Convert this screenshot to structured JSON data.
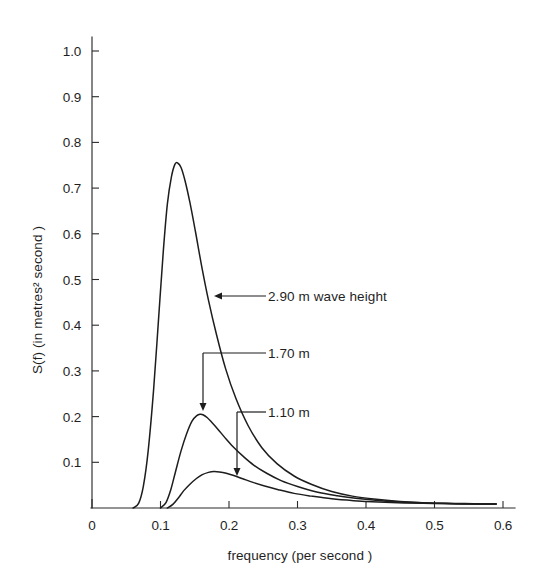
{
  "chart_data": {
    "type": "line",
    "title": "",
    "xlabel": "frequency  (per second )",
    "ylabel": "S(f)   (in metres² second )",
    "xlim": [
      0,
      0.6
    ],
    "ylim": [
      0,
      1.0
    ],
    "grid": false,
    "legend_position": "inline-annotations",
    "xticks": [
      0,
      0.1,
      0.2,
      0.3,
      0.4,
      0.5,
      0.6
    ],
    "xtick_labels": [
      "0",
      "0.1",
      "0.2",
      "0.3",
      "0.4",
      "0.5",
      "0.6"
    ],
    "xtick_labels_visible": [
      "0",
      "0.1",
      "0.2",
      "0.3",
      "0.4",
      "0.5",
      "0.6"
    ],
    "yticks": [
      0,
      0.1,
      0.2,
      0.3,
      0.4,
      0.5,
      0.6,
      0.7,
      0.8,
      0.9,
      1.0
    ],
    "ytick_labels": [
      "0.1",
      "0.2",
      "0.3",
      "0.4",
      "0.5",
      "0.6",
      "0.7",
      "0.8",
      "0.9",
      "1.0"
    ],
    "series": [
      {
        "name": "2.90 m wave height",
        "peak_x": 0.125,
        "peak_y": 0.755,
        "onset_x": 0.065,
        "x": [
          0.06,
          0.068,
          0.075,
          0.082,
          0.09,
          0.097,
          0.104,
          0.11,
          0.116,
          0.121,
          0.125,
          0.13,
          0.136,
          0.143,
          0.151,
          0.16,
          0.17,
          0.182,
          0.195,
          0.21,
          0.228,
          0.248,
          0.27,
          0.295,
          0.32,
          0.35,
          0.38,
          0.415,
          0.45,
          0.49,
          0.53,
          0.57,
          0.59
        ],
        "y": [
          0.0,
          0.01,
          0.048,
          0.125,
          0.26,
          0.41,
          0.56,
          0.665,
          0.725,
          0.752,
          0.755,
          0.745,
          0.715,
          0.668,
          0.605,
          0.53,
          0.455,
          0.378,
          0.305,
          0.24,
          0.18,
          0.132,
          0.097,
          0.07,
          0.052,
          0.036,
          0.026,
          0.019,
          0.014,
          0.011,
          0.01,
          0.009,
          0.009
        ]
      },
      {
        "name": "1.70 m",
        "peak_x": 0.16,
        "peak_y": 0.205,
        "onset_x": 0.103,
        "x": [
          0.1,
          0.108,
          0.115,
          0.122,
          0.13,
          0.138,
          0.146,
          0.153,
          0.158,
          0.162,
          0.168,
          0.175,
          0.184,
          0.194,
          0.206,
          0.22,
          0.236,
          0.255,
          0.276,
          0.3,
          0.328,
          0.358,
          0.392,
          0.43,
          0.47,
          0.515,
          0.56,
          0.59
        ],
        "y": [
          0.0,
          0.012,
          0.04,
          0.08,
          0.125,
          0.162,
          0.19,
          0.202,
          0.205,
          0.204,
          0.198,
          0.187,
          0.172,
          0.154,
          0.134,
          0.114,
          0.094,
          0.076,
          0.06,
          0.047,
          0.035,
          0.027,
          0.02,
          0.015,
          0.012,
          0.01,
          0.009,
          0.009
        ]
      },
      {
        "name": "1.10 m",
        "peak_x": 0.178,
        "peak_y": 0.08,
        "onset_x": 0.112,
        "x": [
          0.11,
          0.118,
          0.126,
          0.134,
          0.143,
          0.152,
          0.161,
          0.17,
          0.178,
          0.186,
          0.196,
          0.207,
          0.22,
          0.235,
          0.252,
          0.272,
          0.295,
          0.32,
          0.35,
          0.382,
          0.418,
          0.456,
          0.498,
          0.54,
          0.575,
          0.59
        ],
        "y": [
          0.0,
          0.008,
          0.022,
          0.038,
          0.052,
          0.064,
          0.073,
          0.078,
          0.08,
          0.079,
          0.076,
          0.071,
          0.064,
          0.056,
          0.048,
          0.04,
          0.032,
          0.026,
          0.02,
          0.016,
          0.013,
          0.011,
          0.01,
          0.009,
          0.009,
          0.009
        ]
      }
    ],
    "annotations": [
      {
        "label": "2.90 m  wave height",
        "target_series": "2.90 m wave height",
        "text_x": 268,
        "text_y": 301,
        "line": {
          "x1": 216,
          "y1": 296,
          "x2": 266,
          "y2": 296
        },
        "arrow": {
          "x": 214,
          "y": 296,
          "dir": "left"
        }
      },
      {
        "label": "1.70 m",
        "target_series": "1.70 m",
        "text_x": 268,
        "text_y": 358,
        "line_h": {
          "x1": 203,
          "y1": 353,
          "x2": 266,
          "y2": 353
        },
        "line_v": {
          "x1": 203,
          "y1": 353,
          "x2": 203,
          "y2": 409
        },
        "arrow": {
          "x": 203,
          "y": 411,
          "dir": "down"
        }
      },
      {
        "label": "1.10 m",
        "target_series": "1.10 m",
        "text_x": 268,
        "text_y": 417,
        "line_h": {
          "x1": 237,
          "y1": 412,
          "x2": 266,
          "y2": 412
        },
        "line_v": {
          "x1": 237,
          "y1": 412,
          "x2": 237,
          "y2": 474
        },
        "arrow": {
          "x": 237,
          "y": 476,
          "dir": "down"
        }
      }
    ]
  },
  "figure": {
    "background_color": "#ffffff",
    "ink_color": "#1d1d1d"
  }
}
